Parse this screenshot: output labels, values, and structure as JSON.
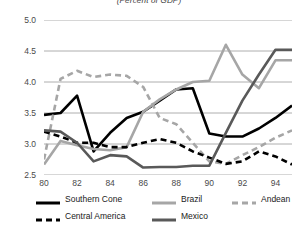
{
  "chart_data": {
    "type": "line",
    "title": "",
    "subtitle": "(Percent of GDP)",
    "xlabel": "",
    "ylabel": "",
    "xlim": [
      80,
      95
    ],
    "ylim": [
      2.5,
      5.0
    ],
    "ytick_labels": [
      "5.0",
      "4.5",
      "4.0",
      "3.5",
      "3.0",
      "2.5"
    ],
    "yticks": [
      5.0,
      4.5,
      4.0,
      3.5,
      3.0,
      2.5
    ],
    "xtick_labels": [
      "80",
      "82",
      "84",
      "86",
      "88",
      "90",
      "92",
      "94"
    ],
    "xticks": [
      80,
      82,
      84,
      86,
      88,
      90,
      92,
      94
    ],
    "x": [
      80,
      81,
      82,
      83,
      84,
      85,
      86,
      87,
      88,
      89,
      90,
      91,
      92,
      93,
      94,
      95
    ],
    "grid": "horizontal",
    "legend_position": "bottom",
    "series": [
      {
        "name": "Southern Cone",
        "color": "#000000",
        "style": "solid",
        "values": [
          3.47,
          3.5,
          3.78,
          2.88,
          3.18,
          3.42,
          3.52,
          3.7,
          3.88,
          3.9,
          3.17,
          3.12,
          3.12,
          3.25,
          3.42,
          3.62
        ]
      },
      {
        "name": "Brazil",
        "color": "#a6a6a6",
        "style": "solid",
        "values": [
          2.67,
          3.05,
          2.98,
          2.92,
          2.9,
          2.95,
          3.52,
          3.72,
          3.88,
          4.0,
          4.02,
          4.6,
          4.12,
          3.9,
          4.35,
          4.35
        ]
      },
      {
        "name": "Andean",
        "color": "#a6a6a6",
        "style": "dashed",
        "values": [
          2.75,
          4.05,
          4.18,
          4.08,
          4.12,
          4.1,
          3.92,
          3.42,
          3.32,
          3.02,
          2.72,
          2.68,
          2.82,
          2.95,
          3.1,
          3.22
        ]
      },
      {
        "name": "Central America",
        "color": "#000000",
        "style": "dashed",
        "values": [
          3.2,
          3.12,
          3.02,
          3.02,
          2.95,
          2.95,
          3.02,
          3.08,
          3.02,
          2.88,
          2.78,
          2.68,
          2.72,
          2.88,
          2.8,
          2.67
        ]
      },
      {
        "name": "Mexico",
        "color": "#595959",
        "style": "solid",
        "values": [
          3.22,
          3.2,
          3.02,
          2.72,
          2.82,
          2.8,
          2.62,
          2.63,
          2.63,
          2.65,
          2.65,
          3.18,
          3.7,
          4.12,
          4.52,
          4.52
        ]
      }
    ]
  }
}
